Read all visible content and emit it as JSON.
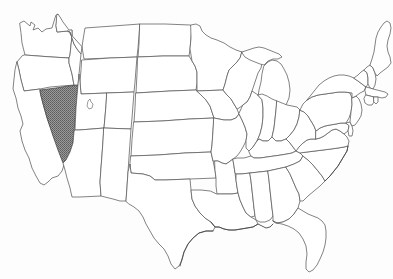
{
  "map": {
    "title": "Map of the United States",
    "description": "Outline map of the contiguous United States with state borders; the state of Nevada is shaded.",
    "region": "Contiguous United States",
    "highlighted_state": "Nevada",
    "highlight_style": "gray halftone fill",
    "colors": {
      "background": "#fdfdfd",
      "state_fill": "#ffffff",
      "border_line": "#5a5a5a",
      "highlight_fill": "#808080",
      "highlight_stroke": "#4a4a4a"
    },
    "labels": {
      "none_visible": ""
    },
    "features": [
      {
        "name": "state-borders",
        "kind": "line",
        "visible": true
      },
      {
        "name": "coastline",
        "kind": "line",
        "visible": true
      },
      {
        "name": "great-salt-lake",
        "kind": "lake",
        "visible": true
      },
      {
        "name": "nevada-highlight",
        "kind": "fill",
        "visible": true
      }
    ],
    "states_visible": [
      "Washington",
      "Oregon",
      "California",
      "Nevada",
      "Idaho",
      "Montana",
      "Wyoming",
      "Utah",
      "Arizona",
      "Colorado",
      "New Mexico",
      "North Dakota",
      "South Dakota",
      "Nebraska",
      "Kansas",
      "Oklahoma",
      "Texas",
      "Minnesota",
      "Iowa",
      "Missouri",
      "Arkansas",
      "Louisiana",
      "Wisconsin",
      "Illinois",
      "Michigan",
      "Indiana",
      "Ohio",
      "Kentucky",
      "Tennessee",
      "Mississippi",
      "Alabama",
      "Georgia",
      "Florida",
      "South Carolina",
      "North Carolina",
      "Virginia",
      "West Virginia",
      "Maryland",
      "Delaware",
      "Pennsylvania",
      "New Jersey",
      "New York",
      "Connecticut",
      "Rhode Island",
      "Massachusetts",
      "Vermont",
      "New Hampshire",
      "Maine"
    ]
  }
}
